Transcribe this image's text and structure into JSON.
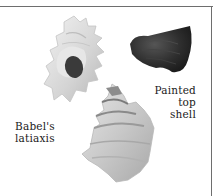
{
  "illustration": {
    "shells": [
      {
        "id": "babels-latiaxis-upper",
        "tone": "pale-grey"
      },
      {
        "id": "painted-top-shell",
        "tone": "dark-charcoal"
      },
      {
        "id": "babels-latiaxis-lower",
        "tone": "pale-grey"
      }
    ],
    "labels": {
      "babels_latiaxis": {
        "line1": "Babel's",
        "line2": "latiaxis"
      },
      "painted_top_shell": {
        "line1": "Painted",
        "line2": "top",
        "line3": "shell"
      }
    },
    "colors": {
      "frame": "#6e6e6e",
      "background": "#ffffff",
      "dark_shell": "#2b2b2b",
      "pale_shell": "#d8d8d8"
    }
  }
}
